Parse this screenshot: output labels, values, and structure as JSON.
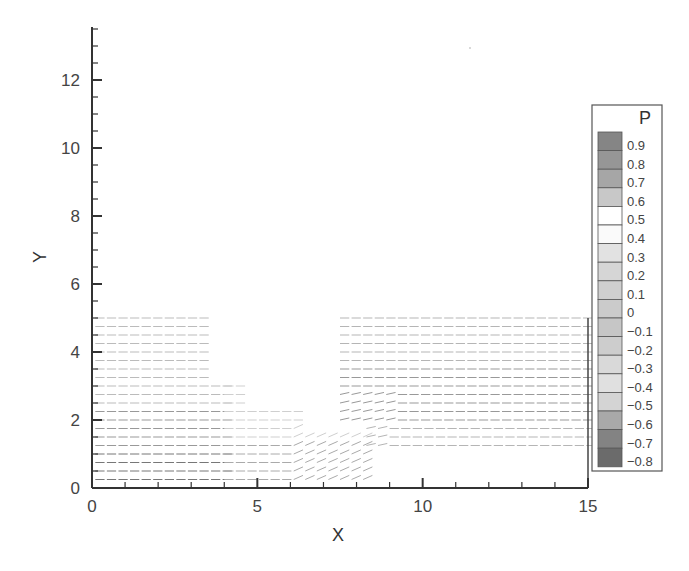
{
  "chart_data": {
    "type": "vector-field",
    "title": "",
    "xlabel": "X",
    "ylabel": "Y",
    "xlim": [
      0,
      15
    ],
    "ylim": [
      0,
      13.6
    ],
    "xticks": [
      0,
      5,
      10,
      15
    ],
    "xtick_labels": [
      "0",
      "5",
      "10",
      "15"
    ],
    "x_minor_step": 1,
    "yticks": [
      0,
      2,
      4,
      6,
      8,
      10,
      12
    ],
    "ytick_labels": [
      "0",
      "2",
      "4",
      "6",
      "8",
      "10",
      "12"
    ],
    "y_minor_step": 0.5,
    "grid": false,
    "legend_position": "right",
    "legend": {
      "title": "P",
      "levels": [
        "0.9",
        "0.8",
        "0.7",
        "0.6",
        "0.5",
        "0.4",
        "0.3",
        "0.2",
        "0.1",
        "0",
        "-0.1",
        "-0.2",
        "-0.3",
        "-0.4",
        "-0.5",
        "-0.6",
        "-0.7",
        "-0.8"
      ],
      "colors": [
        "#858585",
        "#969696",
        "#a6a6a6",
        "#c8c8c8",
        "#ffffff",
        "#fafafa",
        "#e2e2e2",
        "#d6d6d6",
        "#cfcfcf",
        "#cbcbcb",
        "#c6c6c6",
        "#cdcdcd",
        "#d9d9d9",
        "#e0e0e0",
        "#d4d4d4",
        "#a9a9a9",
        "#838383",
        "#6b6b6b"
      ]
    },
    "vector_regions": [
      {
        "name": "inlet-upstream",
        "x_start": 0,
        "x_end": 7.0,
        "y_start": 0.25,
        "y_end": 5.0,
        "row_spacing": 0.25
      },
      {
        "name": "downstream-channel",
        "x_start": 7.5,
        "x_end": 15.0,
        "y_start": 1.25,
        "y_end": 5.0,
        "row_spacing": 0.25
      }
    ],
    "annotations": []
  }
}
